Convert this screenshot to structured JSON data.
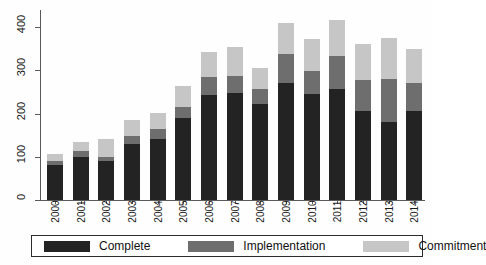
{
  "chart_data": {
    "type": "bar",
    "subtype": "stacked-bar",
    "title": "",
    "subtitle": "",
    "xlabel": "",
    "ylabel": "",
    "categories": [
      "2000",
      "2001",
      "2002",
      "2003",
      "2004",
      "2005",
      "2006",
      "2007",
      "2008",
      "2009",
      "2010",
      "2011",
      "2012",
      "2013",
      "2014"
    ],
    "series": [
      {
        "name": "Complete",
        "color": "#232323",
        "values": [
          82,
          100,
          91,
          129,
          142,
          190,
          244,
          248,
          223,
          272,
          246,
          256,
          205,
          180,
          207
        ]
      },
      {
        "name": "Implementation",
        "color": "#6e6e6e",
        "values": [
          8,
          13,
          9,
          19,
          22,
          25,
          40,
          39,
          33,
          66,
          53,
          77,
          72,
          101,
          63
        ]
      },
      {
        "name": "Commitment",
        "color": "#c6c6c6",
        "values": [
          16,
          22,
          41,
          37,
          38,
          48,
          59,
          67,
          50,
          71,
          73,
          85,
          84,
          95,
          80
        ]
      }
    ],
    "totals": [
      106,
      135,
      141,
      185,
      202,
      263,
      343,
      354,
      306,
      409,
      372,
      418,
      361,
      376,
      350
    ],
    "yticks": [
      0,
      100,
      200,
      300,
      400
    ],
    "ytick_labels": [
      "0",
      "100",
      "200",
      "300",
      "400"
    ],
    "ylim": [
      0,
      440
    ],
    "grid": false,
    "legend_position": "bottom",
    "legend_entries": [
      "Complete",
      "Implementation",
      "Commitment"
    ]
  },
  "legend": {
    "items": [
      {
        "label": "Complete",
        "color": "#232323",
        "swatch_name": "legend-swatch-complete"
      },
      {
        "label": "Implementation",
        "color": "#6e6e6e",
        "swatch_name": "legend-swatch-implementation"
      },
      {
        "label": "Commitment",
        "color": "#c6c6c6",
        "swatch_name": "legend-swatch-commitment"
      }
    ]
  },
  "axes": {
    "y_labels": [
      "400",
      "300",
      "200",
      "100",
      "0"
    ],
    "x_labels": [
      "2000",
      "2001",
      "2002",
      "2003",
      "2004",
      "2005",
      "2006",
      "2007",
      "2008",
      "2009",
      "2010",
      "2011",
      "2012",
      "2013",
      "2014"
    ]
  },
  "colors": {
    "complete": "#232323",
    "implementation": "#6e6e6e",
    "commitment": "#c6c6c6",
    "axis": "#5a5a5a",
    "text": "#1a1a1a",
    "background": "#fefefe"
  }
}
